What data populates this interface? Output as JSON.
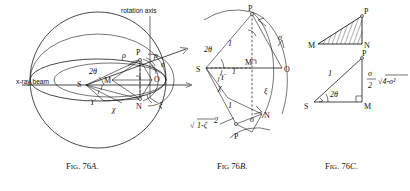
{
  "figure": {
    "plate_title": "Fig. 76A, 76B, 76C — sphere of reflection construction",
    "captions": [
      {
        "id": "cap-76a",
        "prefix": "F",
        "small_caps": "IG",
        "rest": ". 76",
        "italic": "A",
        "suffix": ".",
        "full": "FIG. 76A."
      },
      {
        "id": "cap-76b",
        "prefix": "F",
        "small_caps": "IG",
        "rest": " 76",
        "italic": "B",
        "suffix": ".",
        "full": "FIG 76B."
      },
      {
        "id": "cap-76c",
        "prefix": "F",
        "small_caps": "IG",
        "rest": ". 76",
        "italic": "C",
        "suffix": ".",
        "full": "FIG. 76C."
      }
    ]
  },
  "fig_a": {
    "name": "Fig. 76A",
    "annotations": {
      "rotation_axis": "rotation axis",
      "xray_beam": "x-ray beam",
      "two_theta": "2θ",
      "point_s": "S",
      "point_m": "M",
      "point_o": "O",
      "point_n": "N",
      "point_p": "P",
      "rho_left": "ρ",
      "rho_right": "ρ",
      "sigma": "σ",
      "xi": "ξ",
      "upsilon": "ϒ",
      "chi": "χ"
    }
  },
  "fig_b": {
    "name": "Fig. 76B",
    "annotations": {
      "point_p_top": "P",
      "point_p_bottom": "P",
      "point_s": "S",
      "point_m": "M",
      "point_o": "O",
      "point_n": "N",
      "two_theta": "2θ",
      "one_upper": "1",
      "one_middle": "1",
      "one_lower": "1",
      "sigma_upper": "σ",
      "sigma_lower": "σ",
      "xi": "ξ",
      "upsilon": "ϒ",
      "chi": "χ",
      "radicand": "√1-ζ²",
      "radical_sign": "√",
      "radical_body": "1-ζ",
      "radical_exp": "2"
    }
  },
  "fig_c": {
    "name": "Fig. 76C",
    "annotations": {
      "top_m": "M",
      "top_p": "P",
      "top_n": "N",
      "bottom_p": "P",
      "bottom_s": "S",
      "bottom_m": "M",
      "side_one": "1",
      "two_theta": "2θ",
      "expr_fraction_num": "σ",
      "expr_fraction_den": "2",
      "expr_radical": "√4-σ²",
      "expr_full": "σ/2 √4-σ²"
    }
  },
  "style": {
    "ink": "#1a1a1a",
    "paper": "#ffffff"
  }
}
